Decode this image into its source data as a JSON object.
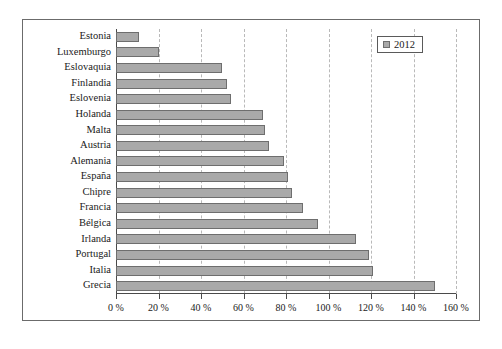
{
  "legend": {
    "label": "2012",
    "swatch_name": "legend-swatch-2012",
    "position": "top-right"
  },
  "colors": {
    "bar_fill": "#a9a9a9",
    "bar_border": "#6e6e6e",
    "frame": "#6b6b6b",
    "gridline": "#b9b9b9",
    "axis": "#4a4a4a",
    "background": "#ffffff",
    "text": "#1a1a1a"
  },
  "caption": {
    "text": ""
  },
  "chart_data": {
    "type": "bar",
    "orientation": "horizontal",
    "title": "",
    "subtitle": "",
    "xlabel": "",
    "ylabel": "",
    "xlim": [
      0,
      160
    ],
    "grid": true,
    "grid_axis": "x",
    "legend_position": "top-right",
    "tick_labels": [
      "0 %",
      "20 %",
      "40 %",
      "60 %",
      "80 %",
      "100 %",
      "120 %",
      "140 %",
      "160 %"
    ],
    "ticks": [
      0,
      20,
      40,
      60,
      80,
      100,
      120,
      140,
      160
    ],
    "categories": [
      "Estonia",
      "Luxemburgo",
      "Eslovaquia",
      "Finlandia",
      "Eslovenia",
      "Holanda",
      "Malta",
      "Austria",
      "Alemania",
      "España",
      "Chipre",
      "Francia",
      "Bélgica",
      "Irlanda",
      "Portugal",
      "Italia",
      "Grecia"
    ],
    "series": [
      {
        "name": "2012",
        "values": [
          11,
          20,
          50,
          52,
          54,
          69,
          70,
          72,
          79,
          81,
          83,
          88,
          95,
          113,
          119,
          121,
          150
        ]
      }
    ]
  }
}
